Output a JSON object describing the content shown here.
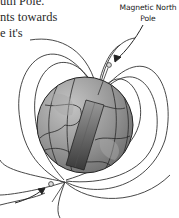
{
  "page": {
    "text_lines": [
      "uth Pole.",
      "nts towards",
      "e it's"
    ]
  },
  "figure": {
    "label_line1": "Magnetic North",
    "label_line2": "Pole",
    "icons": [
      "earth-globe-icon",
      "bar-magnet-icon",
      "field-lines-icon",
      "arrow-icon"
    ],
    "colors": {
      "globe_fill": "#8a8a8a",
      "globe_light": "#b5b5b5",
      "magnet_dark": "#4a4a4a",
      "line": "#333333"
    }
  }
}
